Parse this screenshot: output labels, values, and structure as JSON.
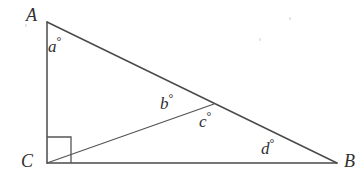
{
  "figure": {
    "canvas": {
      "width": 364,
      "height": 188,
      "background": "#ffffff"
    },
    "stroke_color": "#4a4a4a",
    "label_color": "#303030"
  },
  "vertices": [
    {
      "id": "A",
      "label": "A",
      "x": 47,
      "y": 22,
      "label_x": 26,
      "label_y": 6
    },
    {
      "id": "B",
      "label": "B",
      "x": 337,
      "y": 163,
      "label_x": 344,
      "label_y": 152
    },
    {
      "id": "C",
      "label": "C",
      "x": 47,
      "y": 163,
      "label_x": 21,
      "label_y": 152
    },
    {
      "id": "D",
      "label": "",
      "x": 214,
      "y": 104,
      "label_x": 0,
      "label_y": 0
    }
  ],
  "segments": [
    {
      "name": "side-AC",
      "from": "A",
      "to": "C"
    },
    {
      "name": "side-CB",
      "from": "C",
      "to": "B"
    },
    {
      "name": "hypotenuse-AB",
      "from": "A",
      "to": "B"
    },
    {
      "name": "cevian-CD",
      "from": "C",
      "to": "D"
    }
  ],
  "right_angle": {
    "at": "C",
    "x": 47,
    "y": 137,
    "size": 24
  },
  "angles": [
    {
      "name": "angle-a",
      "symbol": "a",
      "degree": "°",
      "x": 48,
      "y": 35,
      "at_vertex": "A"
    },
    {
      "name": "angle-b",
      "symbol": "b",
      "degree": "°",
      "x": 160,
      "y": 92,
      "at_vertex": "D"
    },
    {
      "name": "angle-c",
      "symbol": "c",
      "degree": "°",
      "x": 199,
      "y": 110,
      "at_vertex": "D"
    },
    {
      "name": "angle-d",
      "symbol": "d",
      "degree": "°",
      "x": 261,
      "y": 137,
      "at_vertex": "B"
    }
  ]
}
